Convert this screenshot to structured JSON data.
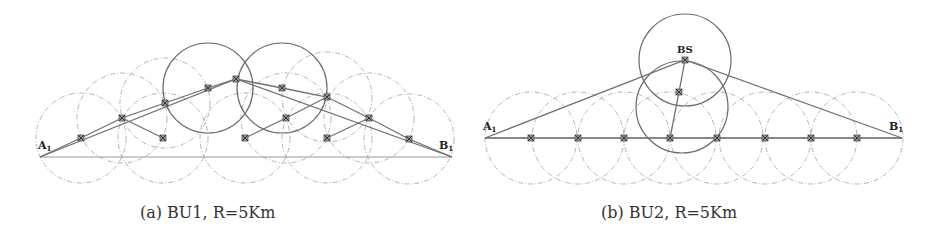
{
  "panels": [
    {
      "id": "a",
      "caption": "(a) BU1, R=5Km",
      "labels": {
        "start": "A",
        "start_sub": "1",
        "end": "B",
        "end_sub": "1"
      },
      "start": [
        40,
        157
      ],
      "end": [
        452,
        157
      ],
      "radius": 45,
      "solid_circles": [
        [
          208,
          88
        ],
        [
          282,
          88
        ]
      ],
      "dashed_circles": [
        [
          81,
          138
        ],
        [
          122,
          118
        ],
        [
          165,
          103
        ],
        [
          163,
          138
        ],
        [
          245,
          138
        ],
        [
          286,
          118
        ],
        [
          327,
          97
        ],
        [
          327,
          138
        ],
        [
          369,
          118
        ],
        [
          409,
          139
        ]
      ],
      "nodes": [
        [
          81,
          138
        ],
        [
          122,
          118
        ],
        [
          165,
          103
        ],
        [
          208,
          88
        ],
        [
          236,
          79
        ],
        [
          282,
          88
        ],
        [
          327,
          97
        ],
        [
          369,
          118
        ],
        [
          409,
          139
        ],
        [
          163,
          138
        ],
        [
          245,
          138
        ],
        [
          286,
          118
        ],
        [
          327,
          138
        ]
      ],
      "paths": [
        [
          [
            40,
            157
          ],
          [
            81,
            138
          ],
          [
            122,
            118
          ],
          [
            165,
            103
          ],
          [
            208,
            88
          ],
          [
            236,
            79
          ],
          [
            282,
            88
          ],
          [
            327,
            97
          ],
          [
            369,
            118
          ],
          [
            409,
            139
          ],
          [
            452,
            157
          ]
        ],
        [
          [
            40,
            157
          ],
          [
            236,
            79
          ],
          [
            452,
            157
          ]
        ],
        [
          [
            122,
            118
          ],
          [
            163,
            138
          ]
        ],
        [
          [
            245,
            138
          ],
          [
            286,
            118
          ],
          [
            327,
            97
          ]
        ],
        [
          [
            327,
            138
          ],
          [
            369,
            118
          ]
        ]
      ]
    },
    {
      "id": "b",
      "caption": "(b) BU2, R=5Km",
      "labels": {
        "start": "A",
        "start_sub": "1",
        "end": "B",
        "end_sub": "1",
        "bs": "BS"
      },
      "start": [
        485,
        138
      ],
      "end": [
        902,
        138
      ],
      "radius": 46,
      "solid_circles": [
        [
          685,
          60
        ],
        [
          682,
          107
        ]
      ],
      "dashed_circles": [
        [
          531,
          138
        ],
        [
          578,
          138
        ],
        [
          624,
          138
        ],
        [
          670,
          138
        ],
        [
          717,
          138
        ],
        [
          765,
          138
        ],
        [
          811,
          138
        ],
        [
          857,
          138
        ]
      ],
      "nodes": [
        [
          531,
          138
        ],
        [
          578,
          138
        ],
        [
          624,
          138
        ],
        [
          670,
          138
        ],
        [
          717,
          138
        ],
        [
          765,
          138
        ],
        [
          811,
          138
        ],
        [
          857,
          138
        ],
        [
          685,
          60
        ],
        [
          679,
          92
        ]
      ],
      "bs": [
        685,
        60
      ],
      "paths": [
        [
          [
            485,
            138
          ],
          [
            902,
            138
          ]
        ],
        [
          [
            485,
            138
          ],
          [
            685,
            60
          ],
          [
            902,
            138
          ]
        ],
        [
          [
            670,
            138
          ],
          [
            679,
            92
          ],
          [
            685,
            60
          ]
        ]
      ]
    }
  ],
  "colors": {
    "solid_circle": "#6a6a6a",
    "dashed_circle": "#b5b5b5",
    "path": "#707070",
    "baseline": "#9a9a9a",
    "node": "#555555"
  }
}
